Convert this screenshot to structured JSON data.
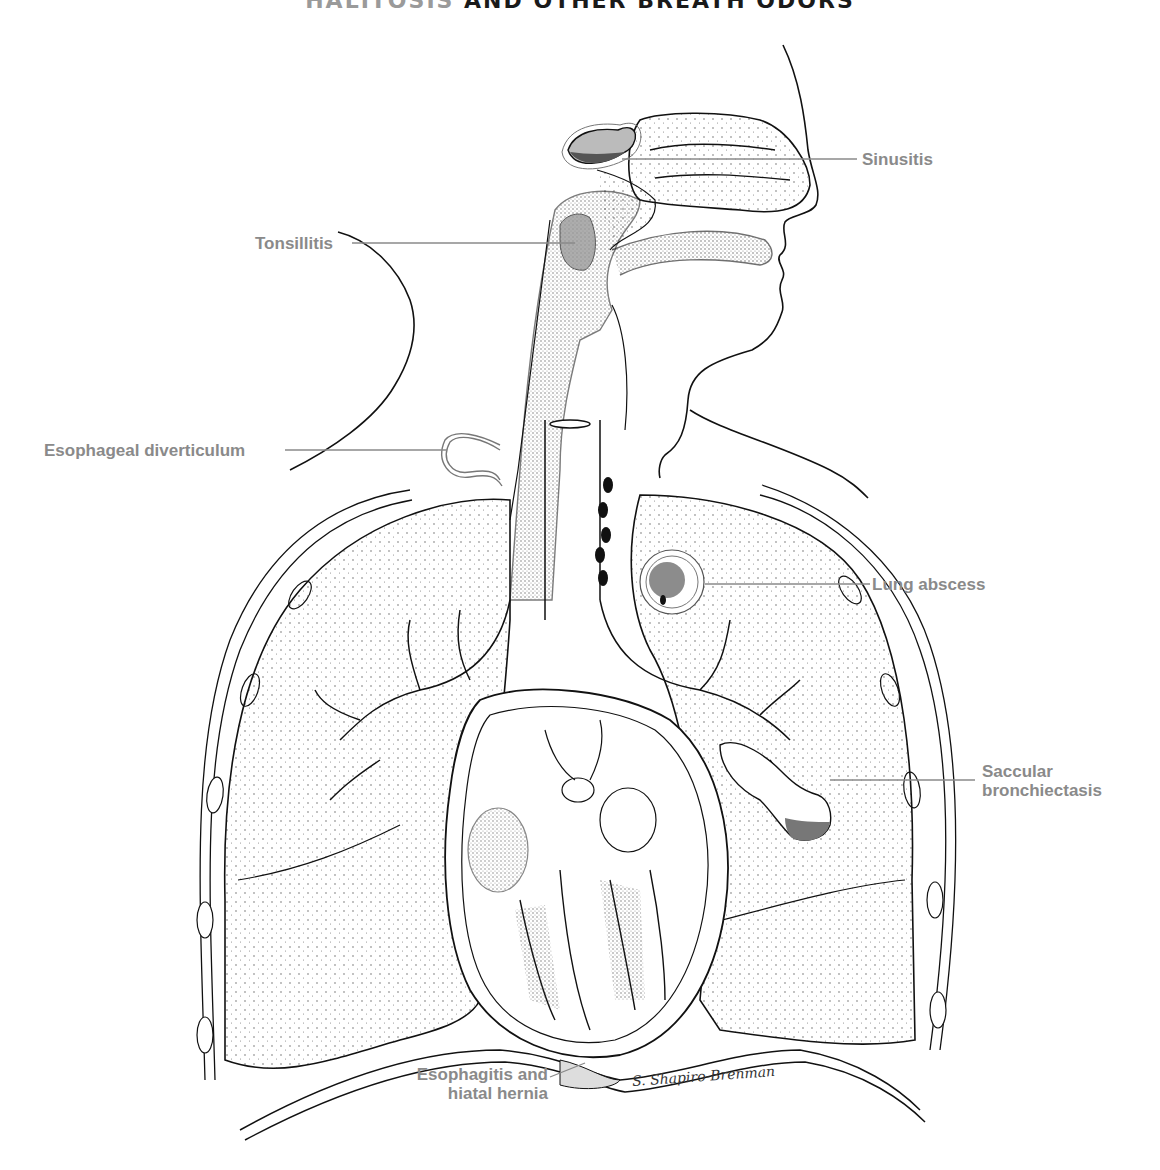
{
  "title": {
    "first_word": "HALITOSIS",
    "rest": "AND OTHER BREATH ODORS"
  },
  "colors": {
    "label_text": "#8a8a8a",
    "leader_line": "#8a8a8a",
    "ink": "#111111",
    "pathology_fill": "#7a7a7a",
    "background": "#ffffff"
  },
  "labels": [
    {
      "id": "sinusitis",
      "text": "Sinusitis"
    },
    {
      "id": "tonsillitis",
      "text": "Tonsillitis"
    },
    {
      "id": "esophageal_diverticulum",
      "text": "Esophageal diverticulum"
    },
    {
      "id": "lung_abscess",
      "text": "Lung abscess"
    },
    {
      "id": "saccular_bronchiectasis",
      "line1": "Saccular",
      "line2": "bronchiectasis"
    },
    {
      "id": "esophagitis_hiatal_hernia",
      "line1": "Esophagitis and",
      "line2": "hiatal hernia"
    }
  ],
  "signature": "S. Shapiro-Brenman"
}
